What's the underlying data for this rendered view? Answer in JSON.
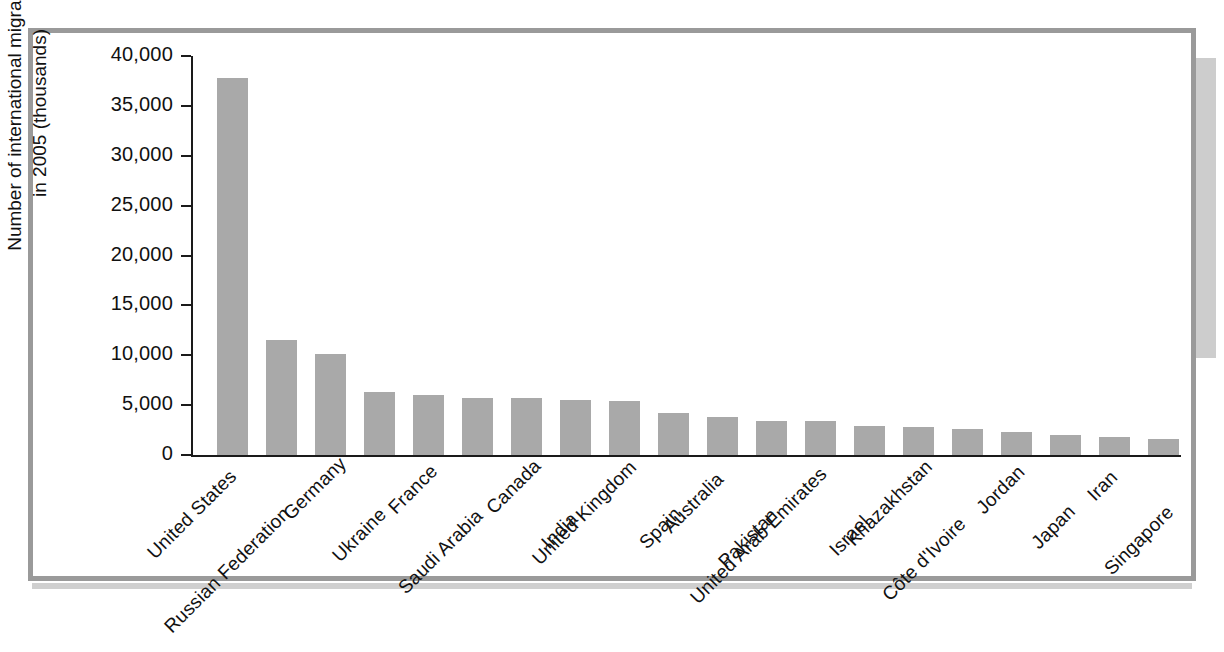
{
  "figure": {
    "border_color": "#9a9a9a",
    "background": "#ffffff"
  },
  "chart_data": {
    "type": "bar",
    "title": "",
    "xlabel": "",
    "ylabel": "Number of international migrants in 2005 (thousands)",
    "ylabel_line1": "Number of international migrants",
    "ylabel_line2": "in 2005 (thousands)",
    "ylim": [
      0,
      40000
    ],
    "ytick_values": [
      0,
      5000,
      10000,
      15000,
      20000,
      25000,
      30000,
      35000,
      40000
    ],
    "ytick_labels": [
      "0",
      "5,000",
      "10,000",
      "15,000",
      "20,000",
      "25,000",
      "30,000",
      "35,000",
      "40,000"
    ],
    "grid": false,
    "legend": null,
    "bar_color": "#a9a9a9",
    "categories": [
      "United States",
      "Russian Federation",
      "Germany",
      "Ukraine",
      "France",
      "Saudi Arabia",
      "Canada",
      "India",
      "United Kingdom",
      "Spain",
      "Australia",
      "Pakistan",
      "United Arab Emirates",
      "Israel",
      "Khazakhstan",
      "Côte d'Ivoire",
      "Jordan",
      "Japan",
      "Iran",
      "Singapore"
    ],
    "values": [
      37800,
      11550,
      10150,
      6350,
      6050,
      5750,
      5700,
      5550,
      5450,
      4250,
      3850,
      3400,
      3400,
      2950,
      2800,
      2600,
      2300,
      2050,
      1850,
      1650
    ]
  }
}
